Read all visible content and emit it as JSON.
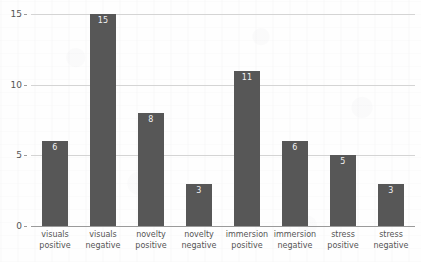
{
  "chart_data": {
    "type": "bar",
    "title": "",
    "subtitle": "",
    "xlabel": "",
    "ylabel": "",
    "categories": [
      "visuals positive",
      "visuals negative",
      "novelty positive",
      "novelty negative",
      "immersion positive",
      "immersion negative",
      "stress positive",
      "stress negative"
    ],
    "category_lines": [
      [
        "visuals",
        "positive"
      ],
      [
        "visuals",
        "negative"
      ],
      [
        "novelty",
        "positive"
      ],
      [
        "novelty",
        "negative"
      ],
      [
        "immersion",
        "positive"
      ],
      [
        "immersion",
        "negative"
      ],
      [
        "stress",
        "positive"
      ],
      [
        "stress",
        "negative"
      ]
    ],
    "values": [
      6,
      15,
      8,
      3,
      11,
      6,
      5,
      3
    ],
    "value_labels": [
      "6",
      "15",
      "8",
      "3",
      "11",
      "6",
      "5",
      "3"
    ],
    "ylim": [
      0,
      15
    ],
    "yticks": [
      0,
      5,
      10,
      15
    ],
    "ytick_labels": [
      "0",
      "5",
      "10",
      "15"
    ],
    "grid": true,
    "grid_axis": "y",
    "legend": false,
    "legend_position": "none",
    "bar_color": "#575757",
    "value_label_color": "#f2f2f2",
    "gridline_color": "#d4d4d4",
    "axis_color": "#9a9a9a",
    "tick_label_color": "#555555",
    "background_color": "#fefefe"
  }
}
